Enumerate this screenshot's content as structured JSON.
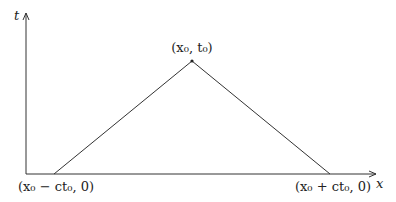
{
  "diagram": {
    "axes": {
      "vertical_label": "t",
      "horizontal_label": "x"
    },
    "apex": {
      "label": "(x₀, t₀)"
    },
    "left_vertex": {
      "label": "(x₀ − ct₀, 0)"
    },
    "right_vertex": {
      "label": "(x₀ + ct₀, 0)"
    },
    "colors": {
      "stroke": "#333333",
      "text": "#222222",
      "background": "#ffffff"
    }
  }
}
